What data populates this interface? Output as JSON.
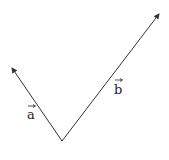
{
  "diagram": {
    "type": "vectors",
    "origin": [
      62,
      141
    ],
    "vectors": [
      {
        "name": "a",
        "label": "a",
        "tip": [
          12,
          68
        ],
        "label_pos": [
          29,
          119
        ]
      },
      {
        "name": "b",
        "label": "b",
        "tip": [
          159,
          14
        ],
        "label_pos": [
          115,
          94
        ]
      }
    ],
    "line_color": "#333333"
  }
}
